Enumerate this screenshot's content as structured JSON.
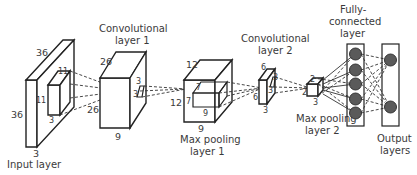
{
  "diagram": {
    "type": "CNN architecture",
    "layers": [
      {
        "id": "input",
        "label": "Input layer",
        "dims": {
          "height": "36",
          "width": "36",
          "depth": "3"
        },
        "kernel": {
          "height": "11",
          "width": "11",
          "depth": "3"
        }
      },
      {
        "id": "conv1",
        "label_line1": "Convolutional",
        "label_line2": "layer 1",
        "dims": {
          "height": "26",
          "width": "26",
          "depth": "9"
        },
        "kernel": {
          "height": "3",
          "width": "3"
        }
      },
      {
        "id": "pool1",
        "label_line1": "Max pooling",
        "label_line2": "layer 1",
        "dims": {
          "height": "12",
          "width": "12",
          "depth": "9"
        },
        "kernel": {
          "height": "7",
          "width": "7",
          "depth": "9"
        }
      },
      {
        "id": "conv2",
        "label_line1": "Convolutional",
        "label_line2": "layer 2",
        "dims": {
          "height": "6",
          "width": "6",
          "depth": "3"
        },
        "kernel": {
          "height": "3",
          "width": "3"
        }
      },
      {
        "id": "pool2",
        "label_line1": "Max pooling",
        "label_line2": "layer 2",
        "dims": {
          "height": "2",
          "width": "2",
          "depth": "3"
        }
      },
      {
        "id": "fc",
        "label_line1": "Fully-",
        "label_line2": "connected",
        "label_line3": "layer",
        "nodes": 5
      },
      {
        "id": "output",
        "label_line1": "Output",
        "label_line2": "layers",
        "nodes": 2
      }
    ],
    "colors": {
      "stroke": "#222222",
      "node_fill": "#5a5a5a",
      "background": "#ffffff"
    }
  }
}
